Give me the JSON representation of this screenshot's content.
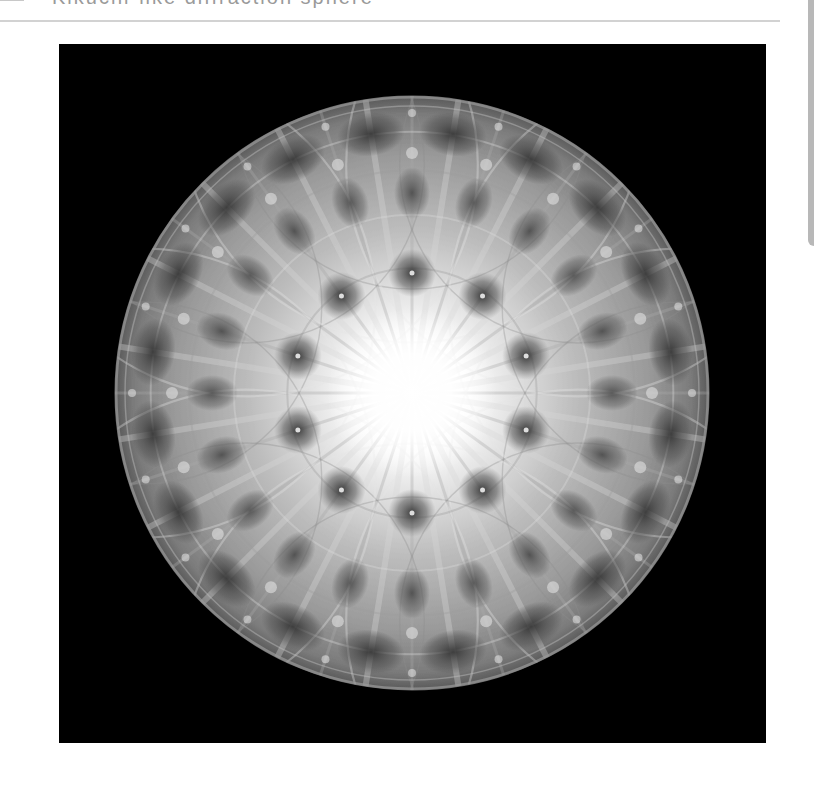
{
  "header": {
    "title": "Kikuchi-like diffraction sphere",
    "title_visible_fragment": "▌ ▘▗ ▖▗▖ ▗▖▖▗▖▗ ▖▗ ▗ ▗▄"
  },
  "figure": {
    "background_color": "#000000",
    "sphere": {
      "center_x": 353,
      "center_y": 349,
      "radius": 297
    },
    "inner_ring_spot_count": 10,
    "outer_lobe_count": 20,
    "colors": {
      "core": "#ffffff",
      "mid": "#c8c8c8",
      "shadow": "#4a4a4a",
      "rim": "#7a7a7a"
    }
  },
  "layout": {
    "divider_color": "#d2d2d2",
    "panel_edge_color": "#b8b8b8"
  }
}
